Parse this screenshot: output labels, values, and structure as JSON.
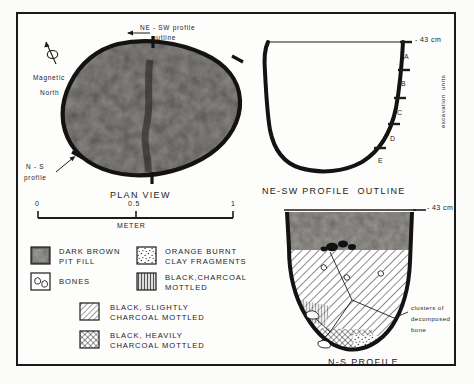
{
  "figure": {
    "panels": {
      "plan": {
        "title": "PLAN VIEW",
        "compass_label_line1": "Magnetic",
        "compass_label_line2": "North",
        "annotation_ne_sw_line1": "NE - SW profile",
        "annotation_ne_sw_line2": "outline",
        "annotation_ns_line1": "N - S",
        "annotation_ns_line2": "profile"
      },
      "ne_sw_profile": {
        "title": "NE-SW PROFILE  OUTLINE",
        "depth_label": "- 43 cm",
        "axis_label": "excavation  units",
        "units": [
          "A",
          "B",
          "C",
          "D",
          "E"
        ]
      },
      "ns_profile": {
        "title": "N-S PROFILE",
        "depth_label": "- 43 cm",
        "annotation_line1": "clusters of",
        "annotation_line2": "decomposed",
        "annotation_line3": "bone"
      }
    },
    "scale_bar": {
      "ticks": [
        "0",
        "0.5",
        "1"
      ],
      "unit_label": "METER"
    },
    "legend": {
      "items": [
        {
          "swatch": "dark-brown-fill",
          "line1": "DARK BROWN",
          "line2": "PIT FILL"
        },
        {
          "swatch": "bones",
          "line1": "BONES",
          "line2": ""
        },
        {
          "swatch": "orange-burnt-clay",
          "line1": "ORANGE BURNT",
          "line2": "CLAY FRAGMENTS"
        },
        {
          "swatch": "black-charcoal-mottled",
          "line1": "BLACK,CHARCOAL",
          "line2": "MOTTLED"
        },
        {
          "swatch": "black-slightly-mottled",
          "line1": "BLACK, SLIGHTLY",
          "line2": "CHARCOAL MOTTLED"
        },
        {
          "swatch": "black-heavily-mottled",
          "line1": "BLACK, HEAVILY",
          "line2": "CHARCOAL MOTTLED"
        }
      ]
    },
    "colors": {
      "ink": "#1c1c1c",
      "paper": "#fdfdfb",
      "pit_fill_dark": "#3a3a3a",
      "pit_fill_mid": "#6e6b66"
    }
  }
}
